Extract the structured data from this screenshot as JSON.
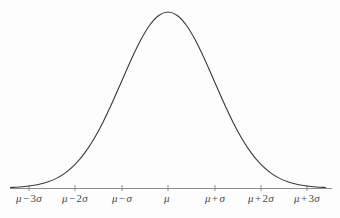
{
  "figure": {
    "title": "",
    "background_color": "#fdfdfd",
    "curve_color": "#3a3a3a",
    "axis_color": "#8c8c8c",
    "label_color": "#4a4a4a"
  },
  "axis": {
    "name": "horizontal-axis",
    "y_pixel": 188,
    "x_start_pixel": 10,
    "x_end_pixel": 332,
    "tick_height_pixels": 5
  },
  "ticks": [
    {
      "label": "μ − 3σ",
      "mu": "μ",
      "op": "−",
      "coef": "3",
      "sigma": "σ",
      "x_pixel": 29,
      "sigma_value": -3
    },
    {
      "label": "μ − 2σ",
      "mu": "μ",
      "op": "−",
      "coef": "2",
      "sigma": "σ",
      "x_pixel": 75,
      "sigma_value": -2
    },
    {
      "label": "μ − σ",
      "mu": "μ",
      "op": "−",
      "coef": "",
      "sigma": "σ",
      "x_pixel": 122,
      "sigma_value": -1
    },
    {
      "label": "μ",
      "mu": "μ",
      "op": "",
      "coef": "",
      "sigma": "",
      "x_pixel": 168,
      "sigma_value": 0
    },
    {
      "label": "μ + σ",
      "mu": "μ",
      "op": "+",
      "coef": "",
      "sigma": "σ",
      "x_pixel": 215,
      "sigma_value": 1
    },
    {
      "label": "μ + 2σ",
      "mu": "μ",
      "op": "+",
      "coef": "2",
      "sigma": "σ",
      "x_pixel": 261,
      "sigma_value": 2
    },
    {
      "label": "μ + 3σ",
      "mu": "μ",
      "op": "+",
      "coef": "3",
      "sigma": "σ",
      "x_pixel": 307,
      "sigma_value": 3
    }
  ],
  "chart_data": {
    "type": "line",
    "title": "",
    "subtitle": "",
    "xlabel": "",
    "ylabel": "",
    "grid": false,
    "legend": false,
    "distribution": "normal",
    "mean": 0,
    "stddev": 1,
    "xlim": [
      -3.4,
      3.4
    ],
    "ylim": [
      0,
      0.4
    ],
    "xtick_labels": [
      "μ − 3σ",
      "μ − 2σ",
      "μ − σ",
      "μ",
      "μ + σ",
      "μ + 2σ",
      "μ + 3σ"
    ],
    "xtick_values": [
      -3,
      -2,
      -1,
      0,
      1,
      2,
      3
    ],
    "ytick_labels": [],
    "ytick_values": [],
    "series": [
      {
        "name": "normal-pdf",
        "color": "#3a3a3a",
        "x": [
          -3.4,
          -3.2,
          -3.0,
          -2.8,
          -2.6,
          -2.4,
          -2.2,
          -2.0,
          -1.8,
          -1.6,
          -1.4,
          -1.2,
          -1.0,
          -0.8,
          -0.6,
          -0.4,
          -0.2,
          0.0,
          0.2,
          0.4,
          0.6,
          0.8,
          1.0,
          1.2,
          1.4,
          1.6,
          1.8,
          2.0,
          2.2,
          2.4,
          2.6,
          2.8,
          3.0,
          3.2,
          3.4
        ],
        "y": [
          0.0012,
          0.0024,
          0.0044,
          0.0079,
          0.0136,
          0.0224,
          0.0355,
          0.054,
          0.079,
          0.1109,
          0.1497,
          0.1942,
          0.242,
          0.2897,
          0.3332,
          0.3683,
          0.391,
          0.3989,
          0.391,
          0.3683,
          0.3332,
          0.2897,
          0.242,
          0.1942,
          0.1497,
          0.1109,
          0.079,
          0.054,
          0.0355,
          0.0224,
          0.0136,
          0.0079,
          0.0044,
          0.0024,
          0.0012
        ]
      }
    ],
    "peak": {
      "x": 0,
      "y": 0.3989,
      "x_pixel": 169,
      "y_pixel": 12
    }
  }
}
